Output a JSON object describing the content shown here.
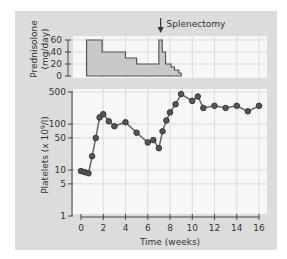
{
  "chart_data": [
    {
      "type": "area",
      "title": "",
      "ylabel": "Prednisolone (mg/day)",
      "xlabel": "",
      "ylim": [
        0,
        60
      ],
      "xlim": [
        0,
        16
      ],
      "yticks": [
        0,
        20,
        40,
        60
      ],
      "annotation": {
        "text": "Splenectomy",
        "x": 7.2,
        "marker": "down-arrow"
      },
      "steps": [
        {
          "x": 0.5,
          "y": 60
        },
        {
          "x": 1.9,
          "y": 40
        },
        {
          "x": 4.0,
          "y": 30
        },
        {
          "x": 5.0,
          "y": 20
        },
        {
          "x": 7.0,
          "y": 60
        },
        {
          "x": 7.3,
          "y": 40
        },
        {
          "x": 7.6,
          "y": 20
        },
        {
          "x": 8.1,
          "y": 15
        },
        {
          "x": 8.4,
          "y": 10
        },
        {
          "x": 8.8,
          "y": 5
        },
        {
          "x": 9.0,
          "y": 0
        }
      ],
      "grid": true,
      "fill_color": "#c8c8c8",
      "line_color": "#555555"
    },
    {
      "type": "line",
      "title": "",
      "xlabel": "Time (weeks)",
      "ylabel": "Platelets (x 10⁹/l)",
      "yscale": "log",
      "ylim": [
        1,
        500
      ],
      "xlim": [
        0,
        16
      ],
      "xticks": [
        0,
        2,
        4,
        6,
        8,
        10,
        12,
        14,
        16
      ],
      "yticks": [
        1,
        5,
        10,
        50,
        100,
        500
      ],
      "grid": true,
      "series": [
        {
          "name": "Platelets",
          "x": [
            0,
            0.33,
            0.67,
            1,
            1.33,
            1.67,
            2,
            2.5,
            3,
            4,
            5,
            6,
            6.5,
            7,
            7.33,
            7.67,
            8,
            8.5,
            9,
            10,
            10.5,
            11,
            12,
            13,
            14,
            15,
            16
          ],
          "values": [
            9.5,
            9,
            8.5,
            20,
            50,
            140,
            165,
            115,
            90,
            110,
            65,
            40,
            45,
            30,
            70,
            120,
            180,
            270,
            450,
            320,
            400,
            225,
            250,
            225,
            250,
            190,
            250
          ],
          "marker": "circle",
          "marker_color": "#555555",
          "line_color": "#666666"
        }
      ]
    }
  ],
  "labels": {
    "pred_ylabel_1": "Prednisolone",
    "pred_ylabel_2": "(mg/day)",
    "plt_ylabel": "Platelets (x 10",
    "plt_ylabel_sup": "9",
    "plt_ylabel_end": "/l)",
    "xlabel": "Time (weeks)",
    "annotation": "Splenectomy"
  },
  "colors": {
    "panel_bg": "#dcdcdc",
    "plot_bg": "#f7f7f7",
    "grid": "#d4d4d4",
    "axis": "#444444"
  }
}
